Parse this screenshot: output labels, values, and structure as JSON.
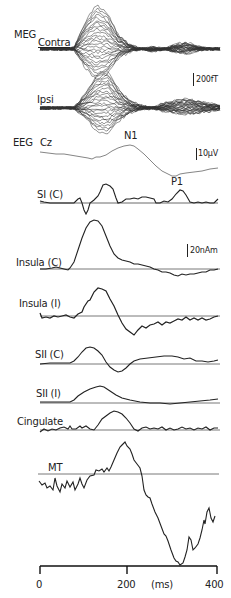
{
  "chart_data": {
    "type": "line",
    "title": "",
    "xlabel": "(ms)",
    "ylabel": "",
    "xlim": [
      0,
      400
    ],
    "x_ticks": [
      0,
      200,
      400
    ],
    "x_tick_labels": [
      "0",
      "200",
      "400"
    ],
    "grid": false,
    "legend": "none",
    "scale_bars": [
      {
        "label": "200fT",
        "applies_to": "MEG"
      },
      {
        "label": "10µV",
        "applies_to": "EEG Cz"
      },
      {
        "label": "20nAm",
        "applies_to": "source waveforms"
      }
    ],
    "annotations": [
      "N1",
      "P1"
    ],
    "x": [
      0,
      25,
      50,
      75,
      100,
      125,
      150,
      175,
      200,
      225,
      250,
      275,
      300,
      325,
      350,
      375,
      400
    ],
    "series": [
      {
        "name": "MEG Contra",
        "unit": "fT",
        "values": [
          0,
          0,
          0,
          5,
          120,
          200,
          160,
          60,
          20,
          0,
          -10,
          0,
          20,
          30,
          10,
          0,
          0
        ]
      },
      {
        "name": "MEG Ipsi",
        "unit": "fT",
        "values": [
          0,
          0,
          0,
          0,
          60,
          140,
          160,
          80,
          30,
          10,
          0,
          20,
          30,
          40,
          30,
          20,
          10
        ]
      },
      {
        "name": "EEG Cz",
        "unit": "µV",
        "values": [
          0,
          0,
          -1,
          -1,
          -2,
          -1,
          4,
          10,
          12,
          8,
          -2,
          -10,
          -16,
          -15,
          -14,
          -14,
          -13
        ]
      },
      {
        "name": "SI (C)",
        "unit": "nAm",
        "values": [
          0,
          0,
          0,
          0,
          3,
          -8,
          5,
          25,
          20,
          3,
          5,
          4,
          0,
          4,
          12,
          2,
          2
        ]
      },
      {
        "name": "Insula (C)",
        "unit": "nAm",
        "values": [
          0,
          1,
          0,
          0,
          50,
          95,
          60,
          25,
          15,
          10,
          5,
          0,
          -4,
          -8,
          -10,
          -6,
          0
        ]
      },
      {
        "name": "Insula (I)",
        "unit": "nAm",
        "values": [
          -3,
          -2,
          -1,
          2,
          10,
          35,
          45,
          20,
          -10,
          -25,
          -18,
          -12,
          -10,
          -8,
          -5,
          -3,
          -2
        ]
      },
      {
        "name": "SII (C)",
        "unit": "nAm",
        "values": [
          0,
          0,
          0,
          1,
          10,
          28,
          20,
          2,
          -8,
          -10,
          -2,
          6,
          10,
          12,
          10,
          6,
          4
        ]
      },
      {
        "name": "SII (I)",
        "unit": "nAm",
        "values": [
          0,
          0,
          0,
          0,
          8,
          22,
          28,
          16,
          6,
          2,
          0,
          -1,
          -2,
          -1,
          0,
          1,
          2
        ]
      },
      {
        "name": "Cingulate",
        "unit": "nAm",
        "values": [
          -3,
          0,
          2,
          3,
          2,
          3,
          10,
          25,
          30,
          20,
          3,
          2,
          3,
          2,
          2,
          2,
          3
        ]
      },
      {
        "name": "MT",
        "unit": "nAm",
        "values": [
          -20,
          -25,
          -25,
          -20,
          -22,
          0,
          5,
          20,
          50,
          40,
          5,
          -40,
          -70,
          -110,
          -155,
          -120,
          -80
        ]
      }
    ]
  },
  "labels": {
    "meg": "MEG",
    "contra": "Contra",
    "ipsi": "Ipsi",
    "eeg": "EEG",
    "cz": "Cz",
    "n1": "N1",
    "p1": "P1",
    "si_c": "SI (C)",
    "insula_c": "Insula (C)",
    "insula_i": "Insula (I)",
    "sii_c": "SII (C)",
    "sii_i": "SII (I)",
    "cingulate": "Cingulate",
    "mt": "MT",
    "scale_meg": "200fT",
    "scale_eeg": "10µV",
    "scale_nam": "20nAm",
    "tick0": "0",
    "tick200": "200",
    "tick400": "400",
    "unit_ms": "(ms)"
  }
}
